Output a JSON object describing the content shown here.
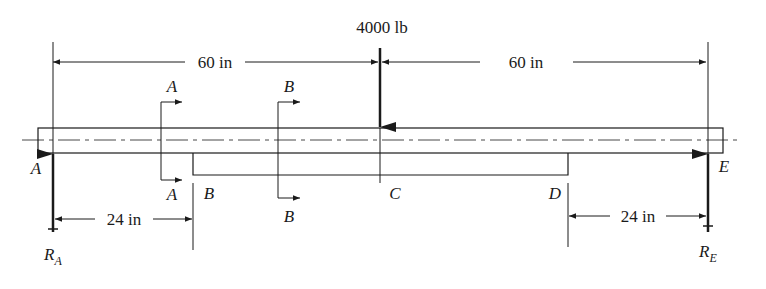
{
  "diagram": {
    "type": "beam-free-body-diagram",
    "load": {
      "label": "4000 lb",
      "direction": "down",
      "at_point": "C"
    },
    "dimensions": {
      "left_span": "60 in",
      "right_span": "60 in",
      "left_offset": "24 in",
      "right_offset": "24 in"
    },
    "points": {
      "A": "A",
      "B": "B",
      "C": "C",
      "D": "D",
      "E": "E"
    },
    "sections": {
      "a_top": "A",
      "a_bottom": "A",
      "b_top": "B",
      "b_bottom": "B"
    },
    "reactions": {
      "ra_main": "R",
      "ra_sub": "A",
      "re_main": "R",
      "re_sub": "E"
    },
    "colors": {
      "line": "#1a1a1a",
      "background": "#ffffff"
    }
  }
}
